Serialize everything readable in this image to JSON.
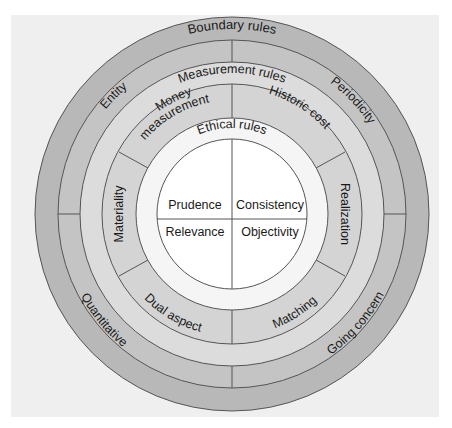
{
  "diagram": {
    "colors": {
      "background": "#efefef",
      "outer_ring": "#b8b8b8",
      "second_ring": "#c4c4c4",
      "measurement_ring": "#dcdcdc",
      "sub_ring": "#d2d2d2",
      "ethical_ring": "#f5f5f5",
      "inner_circle": "#ffffff",
      "stroke": "#555555"
    },
    "rings": {
      "boundary": {
        "label": "Boundary rules",
        "items": [
          "Entity",
          "Periodicity",
          "Quantitative",
          "Going concern"
        ]
      },
      "measurement": {
        "label": "Measurement rules",
        "items": [
          "Money measurement",
          "Historic cost",
          "Materiality",
          "Realization",
          "Dual aspect",
          "Matching"
        ]
      },
      "ethical": {
        "label": "Ethical rules",
        "items": [
          "Prudence",
          "Consistency",
          "Relevance",
          "Objectivity"
        ]
      }
    },
    "labels": {
      "boundary_rules": "Boundary rules",
      "entity": "Entity",
      "periodicity": "Periodicity",
      "quantitative": "Quantitative",
      "going_concern": "Going concern",
      "measurement_rules": "Measurement rules",
      "money": "Money",
      "measurement": "measurement",
      "historic_cost": "Historic cost",
      "materiality": "Materiality",
      "realization": "Realization",
      "dual_aspect": "Dual aspect",
      "matching": "Matching",
      "ethical_rules": "Ethical rules",
      "prudence": "Prudence",
      "consistency": "Consistency",
      "relevance": "Relevance",
      "objectivity": "Objectivity"
    }
  }
}
